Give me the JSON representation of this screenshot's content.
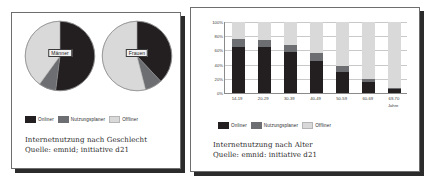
{
  "colors": {
    "onliner": "#231f20",
    "nutzungsplaner": "#6d6e71",
    "offliner": "#d9d9d9",
    "panel_border": "#6e6e6e",
    "shadow": "#2b2b2b",
    "grid": "#c9c9c9",
    "axis": "#8a8a8a",
    "text": "#1f1f1f"
  },
  "legend": {
    "items": [
      {
        "label": "Onliner",
        "color_key": "onliner"
      },
      {
        "label": "Nutzungsplaner",
        "color_key": "nutzungsplaner"
      },
      {
        "label": "Offliner",
        "color_key": "offliner"
      }
    ]
  },
  "left_panel": {
    "caption_line1": "Internetnutzung nach Geschlecht",
    "caption_line2": "Quelle: emnid; initiative d21",
    "legend": [
      {
        "label": "Onliner"
      },
      {
        "label": "Nutzungsplaner"
      },
      {
        "label": "Offliner"
      }
    ],
    "pies": [
      {
        "label": "Männer"
      },
      {
        "label": "Frauen"
      }
    ]
  },
  "right_panel": {
    "caption_line1": "Internetnutzung nach Alter",
    "caption_line2": "Quelle: emnid: initiative d21",
    "legend": [
      {
        "label": "Onliner"
      },
      {
        "label": "Nutzungsplaner"
      },
      {
        "label": "Offliner"
      }
    ],
    "x_unit": "Jahre"
  },
  "chart_data": [
    {
      "type": "pie",
      "title": "Männer",
      "labels": [
        "Onliner",
        "Nutzungsplaner",
        "Offliner"
      ],
      "values": [
        52,
        8,
        40
      ],
      "unit": "%",
      "legend_position": "bottom"
    },
    {
      "type": "pie",
      "title": "Frauen",
      "labels": [
        "Onliner",
        "Nutzungsplaner",
        "Offliner"
      ],
      "values": [
        38,
        8,
        54
      ],
      "unit": "%",
      "legend_position": "bottom"
    },
    {
      "type": "bar",
      "stacked": true,
      "title": "Internetnutzung nach Alter",
      "xlabel": "Jahre",
      "ylabel": "",
      "ylim": [
        0,
        100
      ],
      "ytick_labels": [
        "0%",
        "20%",
        "40%",
        "60%",
        "80%",
        "100%"
      ],
      "ytick_values": [
        0,
        20,
        40,
        60,
        80,
        100
      ],
      "grid": true,
      "categories": [
        "14-19",
        "20-29",
        "30-39",
        "40-49",
        "50-59",
        "60-69",
        "69-70"
      ],
      "series": [
        {
          "name": "Onliner",
          "values": [
            65,
            65,
            58,
            45,
            30,
            15,
            5
          ]
        },
        {
          "name": "Nutzungsplaner",
          "values": [
            11,
            9,
            9,
            11,
            8,
            5,
            2
          ]
        },
        {
          "name": "Offliner",
          "values": [
            24,
            26,
            33,
            44,
            62,
            80,
            93
          ]
        }
      ],
      "legend_position": "bottom"
    }
  ]
}
